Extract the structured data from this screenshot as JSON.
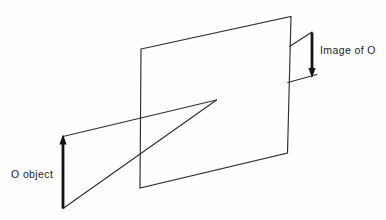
{
  "figure": {
    "labels": {
      "object": "O object",
      "image": "Image of O"
    },
    "colors": {
      "background": "#fefefe",
      "line": "#2e2e2e",
      "arrow": "#141414",
      "text": "#1c1c1c"
    }
  }
}
